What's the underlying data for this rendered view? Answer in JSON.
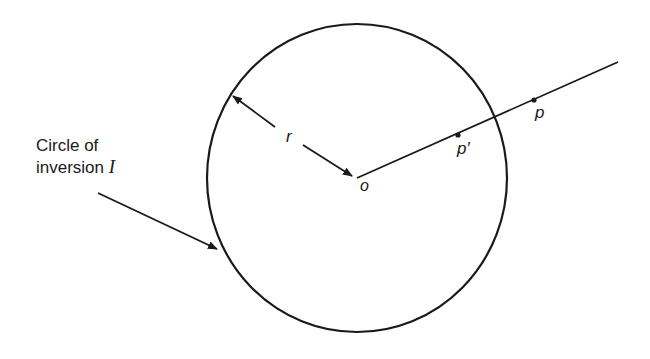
{
  "diagram": {
    "caption_line1": "Circle of",
    "caption_line2": "inversion",
    "caption_symbol": "I",
    "radius_label": "r",
    "center_label": "o",
    "point_inverse_label": "p′",
    "point_label": "p",
    "stroke_color": "#1a1a1a"
  }
}
